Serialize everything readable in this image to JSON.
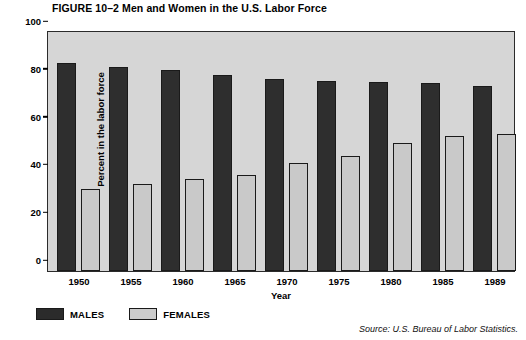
{
  "figure": {
    "title": "FIGURE 10–2  Men and Women in the U.S. Labor Force",
    "source": "Source: U.S. Bureau of Labor Statistics."
  },
  "legend": {
    "items": [
      {
        "label": "MALES",
        "color": "#2b2b2b"
      },
      {
        "label": "FEMALES",
        "color": "#cccccc"
      }
    ]
  },
  "axes": {
    "y_label": "Percent in the labor force",
    "x_label": "Year",
    "y_ticks": [
      "0",
      "20",
      "40",
      "60",
      "80",
      "100"
    ]
  },
  "chart_data": {
    "type": "bar",
    "title": "FIGURE 10–2  Men and Women in the U.S. Labor Force",
    "xlabel": "Year",
    "ylabel": "Percent in the labor force",
    "categories": [
      "1950",
      "1955",
      "1960",
      "1965",
      "1970",
      "1975",
      "1980",
      "1985",
      "1989"
    ],
    "series": [
      {
        "name": "MALES",
        "color": "#2e2e2e",
        "values": [
          87,
          85.5,
          84,
          82,
          80.5,
          79.5,
          79,
          78.5,
          77.5
        ]
      },
      {
        "name": "FEMALES",
        "color": "#c9c9c9",
        "values": [
          34.5,
          36.5,
          38.5,
          40,
          45,
          48,
          53.5,
          56.5,
          57.5
        ]
      }
    ],
    "ylim": [
      0,
      100
    ],
    "ytick_step": 20,
    "grid": false,
    "legend_position": "below-left",
    "plot_background": "#d6d6d6"
  }
}
